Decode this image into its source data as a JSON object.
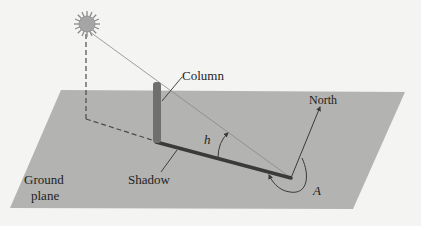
{
  "diagram": {
    "labels": {
      "column": "Column",
      "north": "North",
      "shadow": "Shadow",
      "ground_line1": "Ground",
      "ground_line2": "plane",
      "altitude_angle": "h",
      "azimuth_angle": "A"
    },
    "colors": {
      "background": "#f4f4f2",
      "ground_plane": "#b3b3b1",
      "column": "#6f6f6f",
      "shadow": "#3a3a3a",
      "sun_fill": "#a5a5a5",
      "line": "#555555"
    }
  }
}
